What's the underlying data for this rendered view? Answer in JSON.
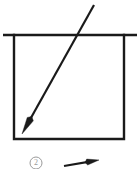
{
  "figure": {
    "background_color": "#ffffff",
    "stroke_color": "#1a1a1a",
    "faint_stroke_color": "#9a9a9a",
    "canvas": {
      "width": 137,
      "height": 169
    }
  },
  "elements": {
    "horizontal_rule": {
      "name": "horizontal-rule",
      "x1": 3,
      "y1": 35,
      "x2": 137,
      "y2": 35,
      "stroke_width": 2.6
    },
    "box": {
      "name": "rectangle-frame",
      "left": 14,
      "top": 35,
      "right": 124,
      "bottom": 139,
      "stroke_width": 2.4,
      "fill": "none"
    },
    "diagonal_arrow": {
      "name": "diagonal-arrow",
      "tail_x": 94,
      "tail_y": 5,
      "tip_x": 22,
      "tip_y": 134,
      "stroke_width": 2.2,
      "arrowhead_length": 17,
      "arrowhead_width": 7
    },
    "lower_circle_marker": {
      "name": "circled-number-marker",
      "center_x": 36,
      "center_y": 163,
      "radius": 6,
      "label": "2",
      "stroke_width": 1
    },
    "lower_arrow_fragment": {
      "name": "secondary-arrow-fragment",
      "tail_x": 64,
      "tail_y": 166,
      "tip_x": 99,
      "tip_y": 160,
      "stroke_width": 2.2,
      "arrowhead_length": 12,
      "arrowhead_width": 6,
      "clipped": "true"
    }
  },
  "labels": {
    "circle_marker_text": "2"
  }
}
